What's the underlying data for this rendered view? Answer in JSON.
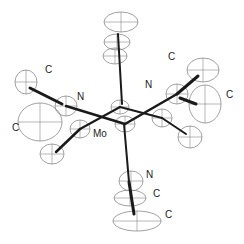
{
  "diagram": {
    "type": "ortep-molecular-structure",
    "colors": {
      "bond": "#1a1a1a",
      "ellipsoid": "#888888",
      "background": "#ffffff",
      "text": "#222222"
    },
    "labels": [
      {
        "id": "lbl-c-upper-left",
        "text": "C",
        "x": 45,
        "y": 70
      },
      {
        "id": "lbl-n-left",
        "text": "N",
        "x": 77,
        "y": 97
      },
      {
        "id": "lbl-c-left",
        "text": "C",
        "x": 12,
        "y": 128
      },
      {
        "id": "lbl-mo",
        "text": "Mo",
        "x": 93,
        "y": 134
      },
      {
        "id": "lbl-c-upper-right",
        "text": "C",
        "x": 168,
        "y": 57
      },
      {
        "id": "lbl-n-right",
        "text": "N",
        "x": 145,
        "y": 85
      },
      {
        "id": "lbl-c-right",
        "text": "C",
        "x": 226,
        "y": 95
      },
      {
        "id": "lbl-n-bottom",
        "text": "N",
        "x": 146,
        "y": 175
      },
      {
        "id": "lbl-c-bottom-1",
        "text": "C",
        "x": 153,
        "y": 194
      },
      {
        "id": "lbl-c-bottom-2",
        "text": "C",
        "x": 165,
        "y": 215
      }
    ],
    "atoms": [
      {
        "id": "top-c3",
        "cx": 121,
        "cy": 22,
        "rx": 17,
        "ry": 10
      },
      {
        "id": "top-c2",
        "cx": 117,
        "cy": 42,
        "rx": 13,
        "ry": 8
      },
      {
        "id": "top-c1",
        "cx": 115,
        "cy": 56,
        "rx": 12,
        "ry": 8
      },
      {
        "id": "mo-1",
        "cx": 120,
        "cy": 107,
        "rx": 9,
        "ry": 7
      },
      {
        "id": "mo-2",
        "cx": 125,
        "cy": 124,
        "rx": 10,
        "ry": 8
      },
      {
        "id": "n-left",
        "cx": 66,
        "cy": 106,
        "rx": 11,
        "ry": 10
      },
      {
        "id": "c-left-far",
        "cx": 26,
        "cy": 82,
        "rx": 11,
        "ry": 12
      },
      {
        "id": "c-left-big",
        "cx": 40,
        "cy": 122,
        "rx": 22,
        "ry": 19
      },
      {
        "id": "c-left-mid",
        "cx": 80,
        "cy": 129,
        "rx": 10,
        "ry": 9
      },
      {
        "id": "c-left-low",
        "cx": 52,
        "cy": 154,
        "rx": 12,
        "ry": 10
      },
      {
        "id": "n-right",
        "cx": 177,
        "cy": 94,
        "rx": 11,
        "ry": 10
      },
      {
        "id": "c-right-far",
        "cx": 203,
        "cy": 70,
        "rx": 16,
        "ry": 12
      },
      {
        "id": "c-right-big",
        "cx": 205,
        "cy": 104,
        "rx": 16,
        "ry": 19
      },
      {
        "id": "c-right-mid",
        "cx": 162,
        "cy": 118,
        "rx": 10,
        "ry": 9
      },
      {
        "id": "c-right-low",
        "cx": 190,
        "cy": 137,
        "rx": 12,
        "ry": 11
      },
      {
        "id": "n-bottom",
        "cx": 131,
        "cy": 181,
        "rx": 12,
        "ry": 10
      },
      {
        "id": "c-bottom-1",
        "cx": 130,
        "cy": 198,
        "rx": 16,
        "ry": 8
      },
      {
        "id": "c-bottom-2",
        "cx": 137,
        "cy": 221,
        "rx": 24,
        "ry": 10
      }
    ],
    "bonds": [
      {
        "x1": 118,
        "y1": 34,
        "x2": 122,
        "y2": 104,
        "w": 2
      },
      {
        "x1": 124,
        "y1": 124,
        "x2": 129,
        "y2": 182,
        "w": 2
      },
      {
        "x1": 129,
        "y1": 182,
        "x2": 134,
        "y2": 214,
        "w": 3
      },
      {
        "x1": 30,
        "y1": 88,
        "x2": 62,
        "y2": 104,
        "w": 3
      },
      {
        "x1": 66,
        "y1": 106,
        "x2": 125,
        "y2": 124,
        "w": 2.5
      },
      {
        "x1": 80,
        "y1": 129,
        "x2": 120,
        "y2": 107,
        "w": 2
      },
      {
        "x1": 80,
        "y1": 129,
        "x2": 56,
        "y2": 152,
        "w": 2.5
      },
      {
        "x1": 120,
        "y1": 107,
        "x2": 162,
        "y2": 118,
        "w": 2
      },
      {
        "x1": 125,
        "y1": 124,
        "x2": 177,
        "y2": 94,
        "w": 2.5
      },
      {
        "x1": 177,
        "y1": 94,
        "x2": 198,
        "y2": 76,
        "w": 3
      },
      {
        "x1": 180,
        "y1": 98,
        "x2": 196,
        "y2": 104,
        "w": 3
      },
      {
        "x1": 162,
        "y1": 118,
        "x2": 186,
        "y2": 134,
        "w": 2
      }
    ]
  }
}
